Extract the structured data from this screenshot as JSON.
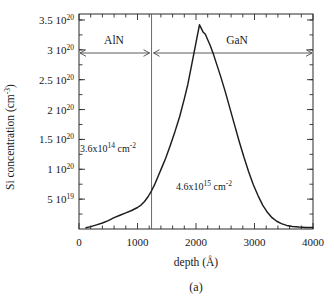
{
  "figure": {
    "caption": "(a)",
    "ylabel_main": "Si concentration (cm",
    "ylabel_sup": "-3",
    "ylabel_close": ")",
    "xlabel": "depth (Å)"
  },
  "axes": {
    "y_ticks": [
      {
        "value": 3.5e+20,
        "mantissa": "3.5 10",
        "exponent": "20"
      },
      {
        "value": 3e+20,
        "mantissa": "3 10",
        "exponent": "20"
      },
      {
        "value": 2.5e+20,
        "mantissa": "2.5 10",
        "exponent": "20"
      },
      {
        "value": 2e+20,
        "mantissa": "2 10",
        "exponent": "20"
      },
      {
        "value": 1.5e+20,
        "mantissa": "1.5 10",
        "exponent": "20"
      },
      {
        "value": 1e+20,
        "mantissa": "1 10",
        "exponent": "20"
      },
      {
        "value": 5e+19,
        "mantissa": "5 10",
        "exponent": "19"
      }
    ],
    "x_ticks": [
      {
        "value": 0,
        "label": "0"
      },
      {
        "value": 1000,
        "label": "1000"
      },
      {
        "value": 2000,
        "label": "2000"
      },
      {
        "value": 3000,
        "label": "3000"
      },
      {
        "value": 4000,
        "label": "4000"
      }
    ],
    "xlim": [
      0,
      4000
    ],
    "ylim": [
      0,
      3.6e+20
    ]
  },
  "annotations": {
    "region_left": "AlN",
    "region_right": "GaN",
    "dose_left_mantissa": "3.6x10",
    "dose_left_exp": "14",
    "dose_left_unit": " cm",
    "dose_left_unit_exp": "-2",
    "dose_right_mantissa": "4.6x10",
    "dose_right_exp": "15",
    "dose_right_unit": " cm",
    "dose_right_unit_exp": "-2",
    "interface_depth": 1240
  },
  "chart_data": {
    "type": "line",
    "title": "",
    "xlabel": "depth (Å)",
    "ylabel": "Si concentration (cm^-3)",
    "xlim": [
      0,
      4000
    ],
    "ylim": [
      0,
      3.6e+20
    ],
    "grid": false,
    "legend": "none",
    "series": [
      {
        "name": "Si SIMS profile",
        "x": [
          120,
          200,
          300,
          400,
          500,
          600,
          700,
          800,
          900,
          1000,
          1060,
          1120,
          1180,
          1240,
          1300,
          1360,
          1420,
          1480,
          1560,
          1640,
          1720,
          1800,
          1860,
          1920,
          1960,
          2000,
          2040,
          2060,
          2090,
          2120,
          2160,
          2200,
          2240,
          2300,
          2360,
          2420,
          2500,
          2580,
          2660,
          2740,
          2820,
          2900,
          2980,
          3060,
          3140,
          3220,
          3300,
          3380,
          3460,
          3550,
          3650,
          3760,
          3880,
          4000
        ],
        "y": [
          2e+18,
          4e+18,
          7e+18,
          1e+19,
          1.4e+19,
          1.9e+19,
          2.3e+19,
          2.7e+19,
          3.1e+19,
          3.6e+19,
          4e+19,
          4.6e+19,
          5.4e+19,
          6.4e+19,
          7.6e+19,
          9e+19,
          1.04e+20,
          1.18e+20,
          1.4e+20,
          1.63e+20,
          1.88e+20,
          2.18e+20,
          2.42e+20,
          2.72e+20,
          2.92e+20,
          3.12e+20,
          3.32e+20,
          3.42e+20,
          3.36e+20,
          3.3e+20,
          3.26e+20,
          3.17e+20,
          3.08e+20,
          2.92e+20,
          2.74e+20,
          2.56e+20,
          2.3e+20,
          2.02e+20,
          1.74e+20,
          1.46e+20,
          1.2e+20,
          9.6e+19,
          7.4e+19,
          5.6e+19,
          4e+19,
          2.8e+19,
          1.9e+19,
          1.3e+19,
          9e+18,
          6e+18,
          4.2e+18,
          3.2e+18,
          2.6e+18,
          2.4e+18
        ]
      }
    ],
    "annotations": [
      {
        "text": "AlN",
        "region_x": [
          0,
          1240
        ]
      },
      {
        "text": "GaN",
        "region_x": [
          1240,
          4000
        ]
      },
      {
        "text": "3.6x10^14 cm^-2",
        "x": 300,
        "y": 1.45e+20
      },
      {
        "text": "4.6x10^15 cm^-2",
        "x": 1900,
        "y": 6e+19
      }
    ]
  }
}
